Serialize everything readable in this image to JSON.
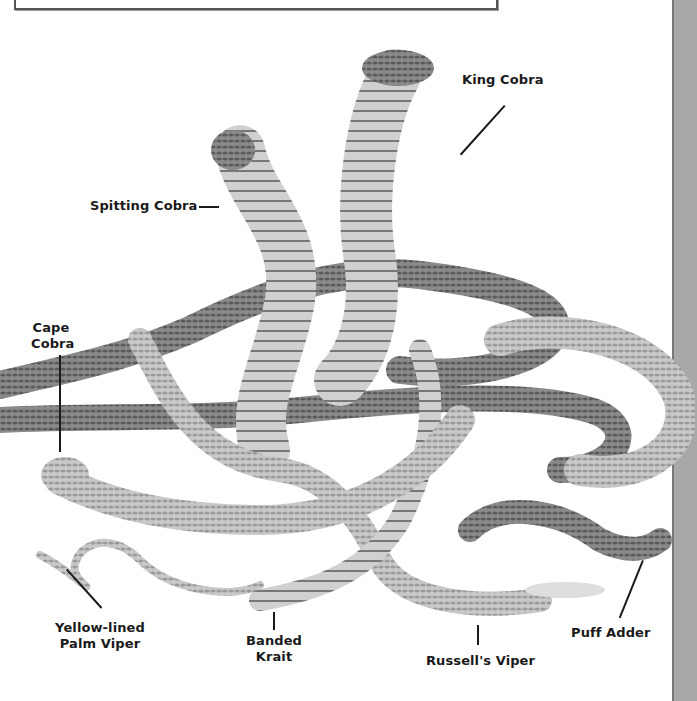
{
  "page": {
    "type": "illustration"
  },
  "labels": [
    {
      "id": "king-cobra",
      "text": "King Cobra"
    },
    {
      "id": "spitting-cobra",
      "text": "Spitting Cobra"
    },
    {
      "id": "cape-cobra",
      "lines": [
        "Cape",
        "Cobra"
      ]
    },
    {
      "id": "yellow-lined-palm-viper",
      "lines": [
        "Yellow-lined",
        "Palm Viper"
      ]
    },
    {
      "id": "banded-krait",
      "lines": [
        "Banded",
        "Krait"
      ]
    },
    {
      "id": "russells-viper",
      "text": "Russell's Viper"
    },
    {
      "id": "puff-adder",
      "text": "Puff Adder"
    }
  ],
  "colors": {
    "background": "#ffffff",
    "text": "#1a1a1a",
    "side_strip": "#a8a8a8",
    "frame": "#555555"
  }
}
